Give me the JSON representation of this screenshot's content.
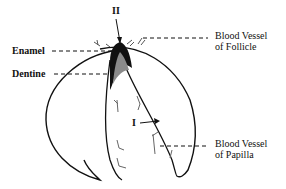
{
  "diagram": {
    "type": "biological-illustration",
    "labels": {
      "enamel": "Enamel",
      "dentine": "Dentine",
      "bv_follicle_line1": "Blood Vessel",
      "bv_follicle_line2": "of Follicle",
      "bv_papilla_line1": "Blood Vessel",
      "bv_papilla_line2": "of Papilla",
      "marker_two": "II",
      "marker_one": "I"
    },
    "colors": {
      "ink": "#111111",
      "dentine_fill": "#8a8a8a",
      "background": "#ffffff"
    }
  }
}
